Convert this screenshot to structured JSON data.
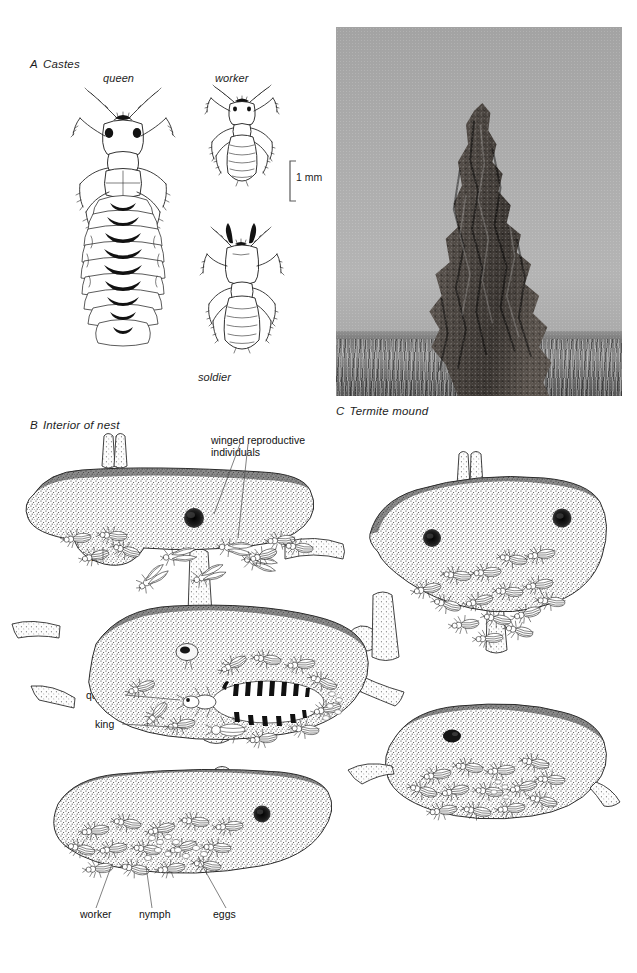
{
  "figure": {
    "panels": [
      {
        "id": "A",
        "letter": "A",
        "title": "Castes"
      },
      {
        "id": "B",
        "letter": "B",
        "title": "Interior of nest"
      },
      {
        "id": "C",
        "letter": "C",
        "title": "Termite mound"
      }
    ]
  },
  "panel_a": {
    "letter": "A",
    "title": "Castes",
    "caste_labels": {
      "queen": "queen",
      "worker": "worker",
      "soldier": "soldier"
    },
    "scale_bar": {
      "label": "1 mm",
      "value": 1,
      "unit": "mm"
    }
  },
  "panel_b": {
    "letter": "B",
    "title": "Interior of nest",
    "labels": {
      "winged": "winged reproductive\nindividuals",
      "winged_line1": "winged reproductive",
      "winged_line2": "individuals",
      "soldier": "soldier",
      "queen": "queen",
      "king": "king",
      "worker": "worker",
      "nymph": "nymph",
      "eggs": "eggs"
    },
    "chamber_count": 5
  },
  "panel_c": {
    "letter": "C",
    "title": "Termite mound",
    "image_kind": "black-and-white-photograph",
    "subject": "termite mound in grassland"
  },
  "colors": {
    "page_background": "#ffffff",
    "ink": "#1b1b1b",
    "label_text": "#1d1d1d",
    "leader_line": "#4a4a4a",
    "photo_sky": "#adadad",
    "photo_mound": "#4a4542",
    "photo_grass": "#767676",
    "stipple": "#2b2b2b"
  }
}
